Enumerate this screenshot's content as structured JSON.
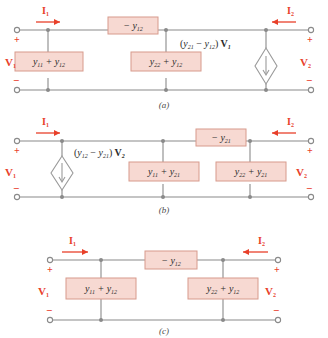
{
  "figure": {
    "colors": {
      "wire": "#8a8a8a",
      "box_fill": "#f7d9d2",
      "box_border": "#d79a8c",
      "red_label": "#e8402a",
      "background": "#ffffff"
    }
  },
  "circuits": [
    {
      "caption": "(a)",
      "terminals": {
        "current_in": "I",
        "current_in_sub": "1",
        "current_out": "I",
        "current_out_sub": "2",
        "voltage_in": "V",
        "voltage_in_sub": "1",
        "voltage_out": "V",
        "voltage_out_sub": "2",
        "plus_left": "+",
        "minus_left": "−",
        "plus_right": "+",
        "minus_right": "−"
      },
      "series_box": {
        "main": "− y",
        "sub": "12"
      },
      "shunt_boxes": [
        {
          "main_a": "y",
          "sub_a": "11",
          "op": "+",
          "main_b": "y",
          "sub_b": "12"
        },
        {
          "main_a": "y",
          "sub_a": "22",
          "op": "+",
          "main_b": "y",
          "sub_b": "12"
        }
      ],
      "source": {
        "type": "dependent-current-source",
        "label_open": "(",
        "term_a_main": "y",
        "term_a_sub": "21",
        "op": "−",
        "term_b_main": "y",
        "term_b_sub": "12",
        "label_close": ")",
        "multiplier_main": "V",
        "multiplier_sub": "1",
        "direction": "down"
      }
    },
    {
      "caption": "(b)",
      "terminals": {
        "current_in": "I",
        "current_in_sub": "1",
        "current_out": "I",
        "current_out_sub": "2",
        "voltage_in": "V",
        "voltage_in_sub": "1",
        "voltage_out": "V",
        "voltage_out_sub": "2",
        "plus_left": "+",
        "minus_left": "−",
        "plus_right": "+",
        "minus_right": "−"
      },
      "series_box": {
        "main": "− y",
        "sub": "21"
      },
      "shunt_boxes": [
        {
          "main_a": "y",
          "sub_a": "11",
          "op": "+",
          "main_b": "y",
          "sub_b": "21"
        },
        {
          "main_a": "y",
          "sub_a": "22",
          "op": "+",
          "main_b": "y",
          "sub_b": "21"
        }
      ],
      "source": {
        "type": "dependent-current-source",
        "label_open": "(",
        "term_a_main": "y",
        "term_a_sub": "12",
        "op": "−",
        "term_b_main": "y",
        "term_b_sub": "21",
        "label_close": ")",
        "multiplier_main": "V",
        "multiplier_sub": "2",
        "direction": "down"
      }
    },
    {
      "caption": "(c)",
      "terminals": {
        "current_in": "I",
        "current_in_sub": "1",
        "current_out": "I",
        "current_out_sub": "2",
        "voltage_in": "V",
        "voltage_in_sub": "1",
        "voltage_out": "V",
        "voltage_out_sub": "2",
        "plus_left": "+",
        "minus_left": "−",
        "plus_right": "+",
        "minus_right": "−"
      },
      "series_box": {
        "main": "− y",
        "sub": "12"
      },
      "shunt_boxes": [
        {
          "main_a": "y",
          "sub_a": "11",
          "op": "+",
          "main_b": "y",
          "sub_b": "12"
        },
        {
          "main_a": "y",
          "sub_a": "22",
          "op": "+",
          "main_b": "y",
          "sub_b": "12"
        }
      ],
      "source": null
    }
  ]
}
